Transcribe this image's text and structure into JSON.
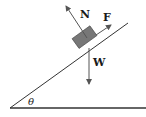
{
  "diagram": {
    "labels": {
      "normal": "N",
      "friction": "F",
      "weight": "W",
      "angle": "θ"
    },
    "colors": {
      "line": "#222222",
      "block": "#777777",
      "arrow": "#555555"
    }
  }
}
